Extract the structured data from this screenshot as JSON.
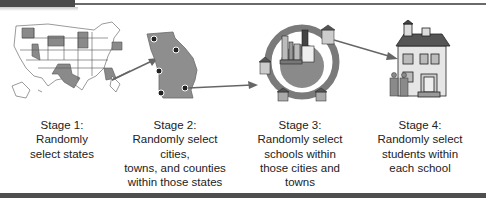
{
  "diagram": {
    "type": "multistage-cluster-sampling",
    "colors": {
      "accent_gray": "#7a7a7a",
      "header_bar": "#4a4a4a",
      "footer_bar": "#4e4e4e",
      "arrow": "#666666"
    },
    "stages": [
      {
        "icon": "us-map-icon",
        "title": "Stage 1:",
        "lines": [
          "Randomly",
          "select states"
        ]
      },
      {
        "icon": "state-map-icon",
        "title": "Stage 2:",
        "lines": [
          "Randomly select",
          "cities,",
          "towns, and counties",
          "within those states"
        ]
      },
      {
        "icon": "city-cluster-icon",
        "title": "Stage 3:",
        "lines": [
          "Randomly select",
          "schools within",
          "those cities and",
          "towns"
        ]
      },
      {
        "icon": "school-students-icon",
        "title": "Stage 4:",
        "lines": [
          "Randomly select",
          "students within",
          "each school"
        ]
      }
    ]
  }
}
